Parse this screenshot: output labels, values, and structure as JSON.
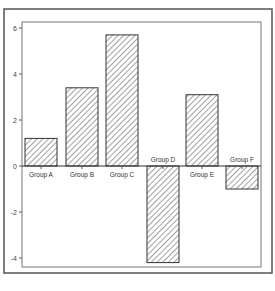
{
  "chart_data": {
    "type": "bar",
    "title": "",
    "xlabel": "",
    "ylabel": "",
    "categories": [
      "Group A",
      "Group B",
      "Group C",
      "Group D",
      "Group E",
      "Group F"
    ],
    "values": [
      1.2,
      3.4,
      5.7,
      -4.2,
      3.1,
      -1.0
    ],
    "ylim": [
      -4.6,
      6.2
    ],
    "yticks": [
      -4,
      -2,
      0,
      2,
      4,
      6
    ],
    "ytick_labels": [
      "-4",
      "-2",
      "0",
      "2",
      "4",
      "6"
    ],
    "grid": false,
    "legend": null,
    "bar_fill": "diagonal-hatch",
    "colors": {
      "bar_stroke": "#333333",
      "hatch": "#444444",
      "frame": "#555555",
      "background": "#ffffff"
    }
  }
}
